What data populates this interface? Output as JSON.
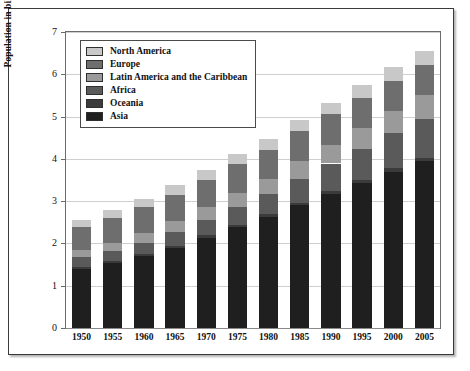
{
  "chart_data": {
    "type": "bar",
    "stacked": true,
    "title": "",
    "xlabel": "",
    "ylabel": "Population in billions",
    "ylim": [
      0,
      7
    ],
    "ytick_values": [
      0,
      1,
      2,
      3,
      4,
      5,
      6,
      7
    ],
    "ytick_labels": [
      "0",
      "1",
      "2",
      "3",
      "4",
      "5",
      "6",
      "7"
    ],
    "grid": true,
    "grid_axis": "y",
    "legend_position": "upper-left-inside",
    "categories": [
      "1950",
      "1955",
      "1960",
      "1965",
      "1970",
      "1975",
      "1980",
      "1985",
      "1990",
      "1995",
      "2000",
      "2005"
    ],
    "series": [
      {
        "name": "Asia",
        "color": "#1f1f1f",
        "values": [
          1.4,
          1.54,
          1.7,
          1.9,
          2.14,
          2.38,
          2.63,
          2.9,
          3.18,
          3.44,
          3.7,
          3.94
        ]
      },
      {
        "name": "Oceania",
        "color": "#3b3b3b",
        "values": [
          0.04,
          0.04,
          0.04,
          0.05,
          0.05,
          0.06,
          0.06,
          0.06,
          0.07,
          0.07,
          0.08,
          0.08
        ]
      },
      {
        "name": "Africa",
        "color": "#5a5a5a",
        "values": [
          0.23,
          0.25,
          0.28,
          0.32,
          0.37,
          0.42,
          0.48,
          0.56,
          0.64,
          0.73,
          0.82,
          0.92
        ]
      },
      {
        "name": "Latin America and the Caribbean",
        "color": "#9a9a9a",
        "values": [
          0.17,
          0.19,
          0.22,
          0.25,
          0.29,
          0.33,
          0.36,
          0.42,
          0.44,
          0.48,
          0.52,
          0.56
        ]
      },
      {
        "name": "Europe",
        "color": "#6e6e6e",
        "values": [
          0.55,
          0.58,
          0.61,
          0.63,
          0.66,
          0.68,
          0.69,
          0.71,
          0.72,
          0.73,
          0.73,
          0.73
        ]
      },
      {
        "name": "North America",
        "color": "#c8c8c8",
        "values": [
          0.17,
          0.19,
          0.2,
          0.22,
          0.23,
          0.24,
          0.25,
          0.27,
          0.28,
          0.3,
          0.32,
          0.33
        ]
      }
    ],
    "totals": [
      2.56,
      2.79,
      3.05,
      3.37,
      3.74,
      4.11,
      4.47,
      4.92,
      5.33,
      5.75,
      6.17,
      6.56
    ],
    "legend_entries": [
      {
        "label": "North America",
        "color": "#c8c8c8"
      },
      {
        "label": "Europe",
        "color": "#6e6e6e"
      },
      {
        "label": "Latin America and the Caribbean",
        "color": "#9a9a9a"
      },
      {
        "label": "Africa",
        "color": "#5a5a5a"
      },
      {
        "label": "Oceania",
        "color": "#3b3b3b"
      },
      {
        "label": "Asia",
        "color": "#1f1f1f"
      }
    ]
  },
  "colors": {
    "plot_background": "#ffffff",
    "grid": "#cfcfcf",
    "axis": "#6b6b6b",
    "frame": "#3a3a3a",
    "text": "#111111"
  }
}
